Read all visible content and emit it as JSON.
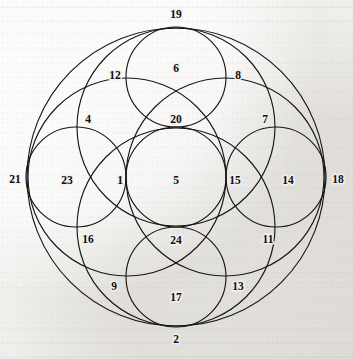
{
  "figure": {
    "background_color": "#f2f1ef",
    "stroke_color": "#171717",
    "label_color": "#101010",
    "outer_circle": {
      "cx": 176,
      "cy": 177,
      "r": 149
    },
    "circles": [
      {
        "name": "outer-boundary-circle",
        "cx": 176,
        "cy": 177,
        "r": 149
      },
      {
        "name": "upper-medium-circle",
        "cx": 176,
        "cy": 127,
        "r": 99
      },
      {
        "name": "left-medium-circle",
        "cx": 127,
        "cy": 177,
        "r": 99
      },
      {
        "name": "right-medium-circle",
        "cx": 225,
        "cy": 177,
        "r": 99
      },
      {
        "name": "lower-medium-circle",
        "cx": 176,
        "cy": 227,
        "r": 99
      },
      {
        "name": "center-small-circle",
        "cx": 176,
        "cy": 177,
        "r": 50
      },
      {
        "name": "top-small-circle",
        "cx": 176,
        "cy": 77,
        "r": 50
      },
      {
        "name": "bottom-small-circle",
        "cx": 176,
        "cy": 277,
        "r": 50
      },
      {
        "name": "left-small-circle",
        "cx": 76,
        "cy": 177,
        "r": 50
      },
      {
        "name": "right-small-circle",
        "cx": 276,
        "cy": 177,
        "r": 50
      }
    ],
    "labels": [
      {
        "id": "label-19",
        "text": "19",
        "x": 176,
        "y": 15,
        "role": "tangent-point-top"
      },
      {
        "id": "label-2",
        "text": "2",
        "x": 176,
        "y": 340,
        "role": "tangent-point-bottom"
      },
      {
        "id": "label-21",
        "text": "21",
        "x": 15,
        "y": 180,
        "role": "tangent-point-left"
      },
      {
        "id": "label-18",
        "text": "18",
        "x": 338,
        "y": 180,
        "role": "tangent-point-right"
      },
      {
        "id": "label-12",
        "text": "12",
        "x": 115,
        "y": 76,
        "role": "intersection-point"
      },
      {
        "id": "label-8",
        "text": "8",
        "x": 238,
        "y": 76,
        "role": "intersection-point"
      },
      {
        "id": "label-6",
        "text": "6",
        "x": 176,
        "y": 69,
        "role": "region"
      },
      {
        "id": "label-4",
        "text": "4",
        "x": 88,
        "y": 120,
        "role": "intersection-point"
      },
      {
        "id": "label-7",
        "text": "7",
        "x": 265,
        "y": 120,
        "role": "intersection-point"
      },
      {
        "id": "label-20",
        "text": "20",
        "x": 176,
        "y": 120,
        "role": "region"
      },
      {
        "id": "label-23",
        "text": "23",
        "x": 67,
        "y": 181,
        "role": "region"
      },
      {
        "id": "label-1",
        "text": "1",
        "x": 120,
        "y": 181,
        "role": "region"
      },
      {
        "id": "label-5",
        "text": "5",
        "x": 176,
        "y": 181,
        "role": "region"
      },
      {
        "id": "label-15",
        "text": "15",
        "x": 235,
        "y": 181,
        "role": "region"
      },
      {
        "id": "label-14",
        "text": "14",
        "x": 288,
        "y": 181,
        "role": "region"
      },
      {
        "id": "label-16",
        "text": "16",
        "x": 88,
        "y": 240,
        "role": "intersection-point"
      },
      {
        "id": "label-11",
        "text": "11",
        "x": 268,
        "y": 240,
        "role": "intersection-point"
      },
      {
        "id": "label-24",
        "text": "24",
        "x": 176,
        "y": 241,
        "role": "region"
      },
      {
        "id": "label-9",
        "text": "9",
        "x": 114,
        "y": 287,
        "role": "intersection-point"
      },
      {
        "id": "label-13",
        "text": "13",
        "x": 238,
        "y": 287,
        "role": "intersection-point"
      },
      {
        "id": "label-17",
        "text": "17",
        "x": 176,
        "y": 298,
        "role": "region"
      }
    ]
  }
}
